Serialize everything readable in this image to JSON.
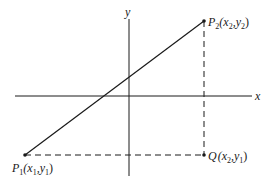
{
  "diagram": {
    "type": "coordinate-plane",
    "colors": {
      "ink": "#1a1a1a",
      "background": "#ffffff"
    },
    "axes": {
      "x_label": "x",
      "y_label": "y"
    },
    "points": {
      "P1": {
        "name": "P",
        "sub": "1",
        "coords_text": [
          "(x",
          "1",
          ",y",
          "1",
          ")"
        ]
      },
      "P2": {
        "name": "P",
        "sub": "2",
        "coords_text": [
          "(x",
          "2",
          ",y",
          "2",
          ")"
        ]
      },
      "Q": {
        "name": "Q",
        "coords_text": [
          "(x",
          "2",
          ",y",
          "1",
          ")"
        ]
      }
    },
    "segments": [
      {
        "from": "P1",
        "to": "P2",
        "style": "solid"
      },
      {
        "from": "P1",
        "to": "Q",
        "style": "dashed"
      },
      {
        "from": "P2",
        "to": "Q",
        "style": "dashed"
      }
    ]
  }
}
